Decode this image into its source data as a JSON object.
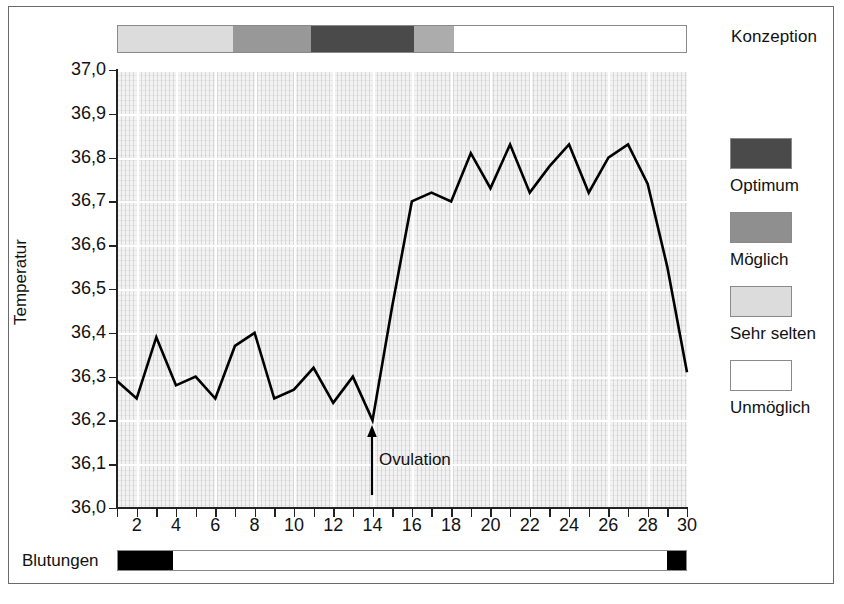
{
  "chart_data": {
    "type": "line",
    "title": "",
    "xlabel": "",
    "ylabel": "Temperatur",
    "xlim": [
      1,
      30
    ],
    "ylim": [
      36.0,
      37.0
    ],
    "grid": true,
    "x": [
      1,
      2,
      3,
      4,
      5,
      6,
      7,
      8,
      9,
      10,
      11,
      12,
      13,
      14,
      15,
      16,
      17,
      18,
      19,
      20,
      21,
      22,
      23,
      24,
      25,
      26,
      27,
      28,
      29,
      30
    ],
    "y_tick_labels": [
      "36,0",
      "36,1",
      "36,2",
      "36,3",
      "36,4",
      "36,5",
      "36,6",
      "36,7",
      "36,8",
      "36,9",
      "37,0"
    ],
    "y_tick_values": [
      36.0,
      36.1,
      36.2,
      36.3,
      36.4,
      36.5,
      36.6,
      36.7,
      36.8,
      36.9,
      37.0
    ],
    "x_tick_labels": [
      "2",
      "4",
      "6",
      "8",
      "10",
      "12",
      "14",
      "16",
      "18",
      "20",
      "22",
      "24",
      "26",
      "28",
      "30"
    ],
    "x_tick_values": [
      2,
      4,
      6,
      8,
      10,
      12,
      14,
      16,
      18,
      20,
      22,
      24,
      26,
      28,
      30
    ],
    "series": [
      {
        "name": "Basaltemperatur",
        "color": "#000000",
        "values": [
          36.29,
          36.25,
          36.39,
          36.28,
          36.3,
          36.25,
          36.37,
          36.4,
          36.25,
          36.27,
          36.32,
          36.24,
          36.3,
          36.2,
          36.46,
          36.7,
          36.72,
          36.7,
          36.81,
          36.73,
          36.83,
          36.72,
          36.78,
          36.83,
          36.72,
          36.8,
          36.83,
          36.74,
          36.55,
          36.31
        ]
      }
    ],
    "annotations": [
      {
        "name": "ovulation",
        "label": "Ovulation",
        "x": 14,
        "y": 36.2,
        "arrow": "up"
      }
    ],
    "legend_position": "right"
  },
  "conception_band": {
    "label": "Konzeption",
    "segments": [
      {
        "name": "sehr-selten",
        "label": "Sehr selten",
        "color": "#dcdcdc",
        "day_start": 1,
        "day_end": 7,
        "width_px": 115
      },
      {
        "name": "moeglich-1",
        "label": "Möglich",
        "color": "#989898",
        "day_start": 7,
        "day_end": 11,
        "width_px": 78
      },
      {
        "name": "optimum",
        "label": "Optimum",
        "color": "#4a4a4a",
        "day_start": 11,
        "day_end": 16,
        "width_px": 103
      },
      {
        "name": "moeglich-2",
        "label": "Möglich",
        "color": "#acacac",
        "day_start": 16,
        "day_end": 18,
        "width_px": 40
      },
      {
        "name": "unmoeglich",
        "label": "Unmöglich",
        "color": "#ffffff",
        "day_start": 18,
        "day_end": 30,
        "width_px": 232
      }
    ]
  },
  "legend": {
    "items": [
      {
        "label": "Optimum",
        "color": "#4a4a4a"
      },
      {
        "label": "Möglich",
        "color": "#8f8f8f"
      },
      {
        "label": "Sehr selten",
        "color": "#dcdcdc"
      },
      {
        "label": "Unmöglich",
        "color": "#ffffff"
      }
    ]
  },
  "bleeding_band": {
    "label": "Blutungen",
    "segments": [
      {
        "name": "bleeding-start",
        "color": "#000000",
        "day_start": 1,
        "day_end": 3.9,
        "width_px": 55
      },
      {
        "name": "no-bleeding",
        "color": "#ffffff",
        "day_start": 3.9,
        "day_end": 29,
        "width_px": 496
      },
      {
        "name": "bleeding-end",
        "color": "#000000",
        "day_start": 29,
        "day_end": 30,
        "width_px": 19
      }
    ]
  }
}
